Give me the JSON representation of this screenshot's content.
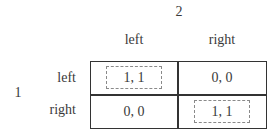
{
  "players": {
    "column_player": "2",
    "row_player": "1"
  },
  "strategies": {
    "columns": [
      "left",
      "right"
    ],
    "rows": [
      "left",
      "right"
    ]
  },
  "payoffs": [
    [
      "1, 1",
      "0, 0"
    ],
    [
      "0, 0",
      "1, 1"
    ]
  ],
  "highlighted_equilibria": [
    {
      "row": 0,
      "col": 0,
      "style": "dashed-box"
    },
    {
      "row": 1,
      "col": 1,
      "style": "dashed-box"
    }
  ],
  "colors": {
    "text": "#3a3a3a",
    "border": "#333333",
    "dashed_box": "#8a8a8a",
    "background": "#ffffff"
  }
}
